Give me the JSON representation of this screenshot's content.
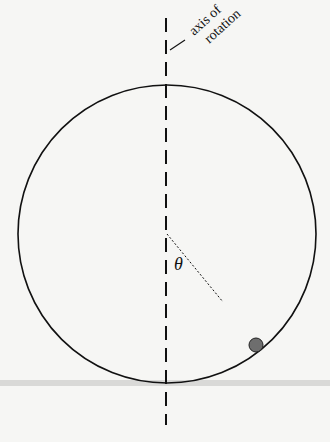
{
  "diagram": {
    "axis_label_line1": "axis of",
    "axis_label_line2": "rotation",
    "angle_symbol": "θ",
    "colors": {
      "background": "#f6f6f4",
      "line": "#111111",
      "bead": "#6e6e6e",
      "band": "#d9d9d7"
    }
  }
}
